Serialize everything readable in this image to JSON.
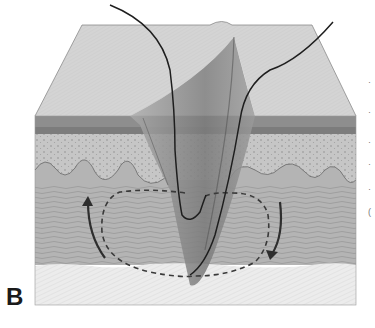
{
  "figure": {
    "panel_label": "B",
    "layers": [
      {
        "name": "skin-surface",
        "color": "#d4d4d4"
      },
      {
        "name": "epidermis",
        "color": "#8a8a8a"
      },
      {
        "name": "papillary-dermis",
        "color": "#c4c4c4"
      },
      {
        "name": "reticular-dermis",
        "color": "#b0b0b0"
      },
      {
        "name": "subcutaneous-fat",
        "color": "#ececec"
      }
    ],
    "annotations": {
      "suture_loop": "dashed elliptical path",
      "arrows": [
        "upward arrow left",
        "downward arrow right"
      ]
    },
    "cropped_side_text": [
      "·",
      "·",
      "·",
      "·",
      "·",
      "("
    ]
  }
}
